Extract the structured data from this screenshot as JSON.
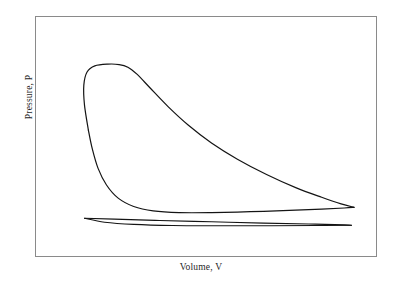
{
  "figure": {
    "background_color": "#ffffff",
    "frame_color": "#8a8a8a",
    "curve_color": "#141414"
  },
  "axes": {
    "x_label": "Volume, V",
    "y_label": "Pressure, P",
    "x_ticks": [],
    "y_ticks": [],
    "grid": false
  },
  "chart_data": {
    "type": "line",
    "title": "",
    "subtitle": "",
    "xlabel": "Volume, V",
    "ylabel": "Pressure, P",
    "xlim": [
      0,
      1
    ],
    "ylim": [
      0,
      1
    ],
    "grid": false,
    "legend": false,
    "annotations": [],
    "tick_labels": {
      "x": [],
      "y": []
    },
    "series": [
      {
        "name": "expansion-curve",
        "description": "Upper high-pressure expansion branch: rises steeply, plateaus near peak pressure, then decays toward large volume.",
        "color": "#141414",
        "width": 1.2,
        "points": [
          [
            0.14,
            0.525
          ],
          [
            0.128,
            0.64
          ],
          [
            0.126,
            0.73
          ],
          [
            0.136,
            0.79
          ],
          [
            0.16,
            0.818
          ],
          [
            0.2,
            0.826
          ],
          [
            0.235,
            0.824
          ],
          [
            0.262,
            0.812
          ],
          [
            0.29,
            0.78
          ],
          [
            0.33,
            0.718
          ],
          [
            0.386,
            0.632
          ],
          [
            0.448,
            0.548
          ],
          [
            0.52,
            0.466
          ],
          [
            0.6,
            0.392
          ],
          [
            0.69,
            0.322
          ],
          [
            0.78,
            0.262
          ],
          [
            0.86,
            0.218
          ],
          [
            0.92,
            0.188
          ],
          [
            0.96,
            0.172
          ]
        ]
      },
      {
        "name": "compression-curve",
        "description": "Lower return branch of the closed loop: sweeps down from the peak region and runs nearly flat to the right tip.",
        "color": "#141414",
        "width": 1.2,
        "points": [
          [
            0.14,
            0.525
          ],
          [
            0.152,
            0.44
          ],
          [
            0.17,
            0.35
          ],
          [
            0.196,
            0.274
          ],
          [
            0.232,
            0.214
          ],
          [
            0.28,
            0.176
          ],
          [
            0.34,
            0.156
          ],
          [
            0.42,
            0.148
          ],
          [
            0.52,
            0.148
          ],
          [
            0.64,
            0.152
          ],
          [
            0.76,
            0.158
          ],
          [
            0.86,
            0.164
          ],
          [
            0.93,
            0.169
          ],
          [
            0.96,
            0.172
          ]
        ]
      },
      {
        "name": "sliver-upper-edge",
        "description": "Upper edge of the thin low-pressure lens near the bottom of the plot.",
        "color": "#141414",
        "width": 1.1,
        "points": [
          [
            0.128,
            0.122
          ],
          [
            0.22,
            0.118
          ],
          [
            0.36,
            0.112
          ],
          [
            0.52,
            0.106
          ],
          [
            0.68,
            0.1
          ],
          [
            0.82,
            0.096
          ],
          [
            0.93,
            0.092
          ],
          [
            0.952,
            0.09
          ]
        ]
      },
      {
        "name": "sliver-lower-edge",
        "description": "Lower edge of the thin low-pressure lens, closing the sliver at both tips.",
        "color": "#141414",
        "width": 1.1,
        "points": [
          [
            0.128,
            0.122
          ],
          [
            0.19,
            0.104
          ],
          [
            0.28,
            0.094
          ],
          [
            0.4,
            0.089
          ],
          [
            0.54,
            0.088
          ],
          [
            0.7,
            0.088
          ],
          [
            0.84,
            0.089
          ],
          [
            0.952,
            0.09
          ]
        ]
      }
    ]
  }
}
